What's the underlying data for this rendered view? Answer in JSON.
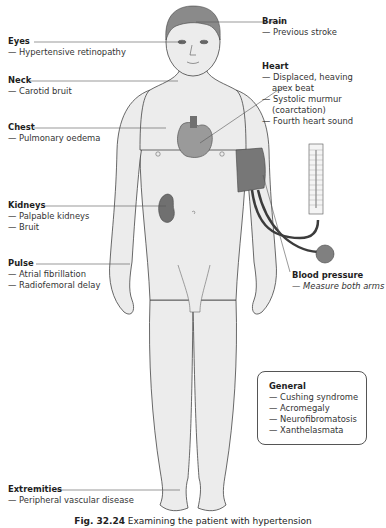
{
  "figure": {
    "caption_number": "Fig. 32.24",
    "caption_text": "Examining the patient with hypertension",
    "colors": {
      "skin": "#ececec",
      "outline": "#444444",
      "hair": "#8a8a8a",
      "organ": "#9a9a9a",
      "organ_dark": "#707070",
      "cuff": "#777777",
      "tube": "#3c3c3c",
      "leader": "#555555"
    }
  },
  "labels": {
    "brain": {
      "title": "Brain",
      "items": [
        "— Previous stroke"
      ]
    },
    "eyes": {
      "title": "Eyes",
      "items": [
        "— Hypertensive retinopathy"
      ]
    },
    "neck": {
      "title": "Neck",
      "items": [
        "— Carotid bruit"
      ]
    },
    "heart": {
      "title": "Heart",
      "items": [
        "— Displaced, heaving",
        "apex beat",
        "— Systolic murmur",
        "(coarctation)",
        "— Fourth heart sound"
      ]
    },
    "chest": {
      "title": "Chest",
      "items": [
        "— Pulmonary oedema"
      ]
    },
    "kidneys": {
      "title": "Kidneys",
      "items": [
        "— Palpable kidneys",
        "— Bruit"
      ]
    },
    "pulse": {
      "title": "Pulse",
      "items": [
        "— Atrial fibrillation",
        "— Radiofemoral delay"
      ]
    },
    "blood_pressure": {
      "title": "Blood pressure",
      "items": [
        "— Measure both arms"
      ]
    },
    "general": {
      "title": "General",
      "items": [
        "— Cushing syndrome",
        "— Acromegaly",
        "— Neurofibromatosis",
        "— Xanthelasmata"
      ]
    },
    "extremities": {
      "title": "Extremities",
      "items": [
        "— Peripheral vascular disease"
      ]
    }
  }
}
